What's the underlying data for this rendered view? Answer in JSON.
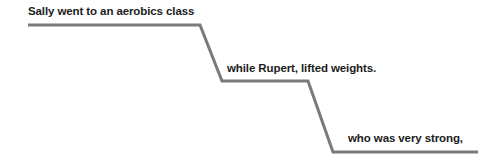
{
  "diagram": {
    "type": "descending-stepped-timeline",
    "background_color": "#ffffff",
    "line_color": "#7a7a7a",
    "text_color": "#1c1c1c",
    "line_width": 3,
    "steps": [
      {
        "label": "Sally went to an aerobics class",
        "level": 1,
        "segment": {
          "x1": 28,
          "y1": 25,
          "x2": 200,
          "y2": 25
        },
        "connector": {
          "x1": 200,
          "y1": 25,
          "x2": 222,
          "y2": 81
        }
      },
      {
        "label": "while Rupert, lifted weights.",
        "level": 2,
        "segment": {
          "x1": 222,
          "y1": 81,
          "x2": 412,
          "y2": 81
        },
        "connector": {
          "x1": 308,
          "y1": 81,
          "x2": 333,
          "y2": 152
        }
      },
      {
        "label": "who was very strong,",
        "level": 3,
        "segment": {
          "x1": 333,
          "y1": 152,
          "x2": 478,
          "y2": 152
        },
        "connector": null
      }
    ]
  }
}
